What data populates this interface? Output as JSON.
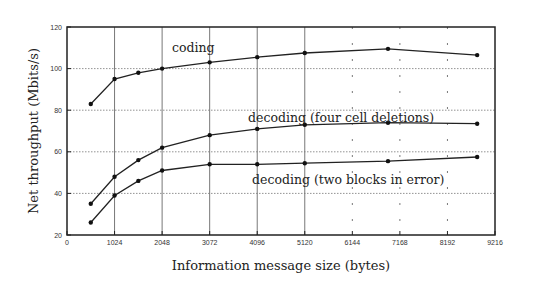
{
  "chart_data": {
    "type": "line",
    "title": "",
    "xlabel": "Information message size (bytes)",
    "ylabel": "Net throughput (Mbits/s)",
    "xlim": [
      0,
      9216
    ],
    "ylim": [
      20,
      120
    ],
    "x_ticks": [
      0,
      1024,
      2048,
      3072,
      4096,
      5120,
      6144,
      7168,
      8192,
      9216
    ],
    "y_ticks": [
      20,
      40,
      60,
      80,
      100,
      120
    ],
    "grid": "dotted horizontal gridlines at 40/60/80/100; vertical gridlines at x ticks",
    "legend": "inline labels next to curves",
    "x": [
      512,
      1024,
      1536,
      2048,
      3072,
      4096,
      5120,
      6912,
      8832
    ],
    "series": [
      {
        "name": "coding",
        "values": [
          83,
          95,
          98,
          100,
          103,
          105.5,
          107.5,
          109.5,
          106.5
        ]
      },
      {
        "name": "decoding (four cell deletions)",
        "values": [
          35,
          48,
          56,
          62,
          68,
          71,
          73,
          74,
          73.5
        ]
      },
      {
        "name": "decoding (two blocks in error)",
        "values": [
          26,
          39,
          46,
          51,
          54,
          54,
          54.5,
          55.5,
          57.5
        ]
      }
    ]
  }
}
